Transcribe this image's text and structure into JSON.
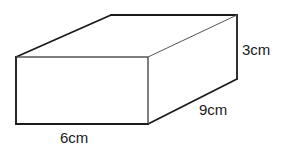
{
  "figure": {
    "type": "cuboid",
    "labels": {
      "height": "3cm",
      "depth": "9cm",
      "width": "6cm"
    },
    "dimensions_cm": {
      "width": 6,
      "depth": 9,
      "height": 3
    }
  }
}
